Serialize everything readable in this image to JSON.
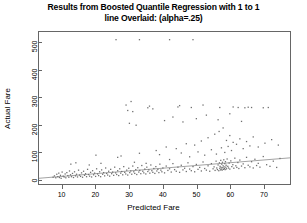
{
  "chart_data": {
    "type": "scatter",
    "title": "Results from Boosted Quantile Regression with 1 to 1 line Overlaid: (alpha=.25)",
    "title_line1": "Results from Boosted Quantile Regression with 1 to 1",
    "title_line2": "line Overlaid: (alpha=.25)",
    "xlabel": "Predicted Fare",
    "ylabel": "Actual Fare",
    "xlim": [
      3,
      78
    ],
    "ylim": [
      -18,
      540
    ],
    "xticks": [
      10,
      20,
      30,
      40,
      50,
      60,
      70
    ],
    "yticks": [
      0,
      100,
      200,
      300,
      400,
      500
    ],
    "grid": false,
    "legend": null,
    "point_color": "#6f6f6f",
    "line_color": "#8a8a8a",
    "frame_color": "#666666",
    "reference_line": {
      "label": "1 to 1 line",
      "x": [
        3,
        78
      ],
      "y": [
        3,
        78
      ],
      "type": "identity"
    },
    "points": [
      [
        7.2,
        7
      ],
      [
        7.6,
        12
      ],
      [
        8.0,
        5
      ],
      [
        8.3,
        18
      ],
      [
        8.6,
        9
      ],
      [
        8.9,
        22
      ],
      [
        9.1,
        6
      ],
      [
        9.4,
        14
      ],
      [
        9.6,
        3
      ],
      [
        9.9,
        26
      ],
      [
        10.2,
        11
      ],
      [
        10.5,
        8
      ],
      [
        10.8,
        19
      ],
      [
        11.0,
        5
      ],
      [
        11.3,
        24
      ],
      [
        11.6,
        13
      ],
      [
        11.9,
        7
      ],
      [
        12.1,
        30
      ],
      [
        12.4,
        16
      ],
      [
        12.7,
        9
      ],
      [
        13.0,
        21
      ],
      [
        13.3,
        6
      ],
      [
        13.6,
        27
      ],
      [
        13.9,
        12
      ],
      [
        14.2,
        18
      ],
      [
        14.5,
        8
      ],
      [
        14.8,
        33
      ],
      [
        15.1,
        15
      ],
      [
        15.4,
        10
      ],
      [
        15.7,
        23
      ],
      [
        16.0,
        7
      ],
      [
        16.3,
        29
      ],
      [
        16.6,
        14
      ],
      [
        16.9,
        20
      ],
      [
        17.2,
        9
      ],
      [
        17.5,
        36
      ],
      [
        17.8,
        17
      ],
      [
        18.1,
        11
      ],
      [
        18.4,
        25
      ],
      [
        18.7,
        8
      ],
      [
        19.0,
        31
      ],
      [
        19.3,
        16
      ],
      [
        19.6,
        22
      ],
      [
        19.9,
        10
      ],
      [
        20.2,
        38
      ],
      [
        20.5,
        19
      ],
      [
        20.8,
        13
      ],
      [
        21.1,
        27
      ],
      [
        21.4,
        9
      ],
      [
        21.7,
        34
      ],
      [
        22.0,
        18
      ],
      [
        22.3,
        24
      ],
      [
        22.6,
        12
      ],
      [
        22.9,
        41
      ],
      [
        23.2,
        21
      ],
      [
        23.5,
        15
      ],
      [
        23.8,
        29
      ],
      [
        24.1,
        11
      ],
      [
        24.4,
        36
      ],
      [
        24.7,
        20
      ],
      [
        25.0,
        26
      ],
      [
        25.3,
        14
      ],
      [
        25.6,
        44
      ],
      [
        25.9,
        23
      ],
      [
        26.2,
        17
      ],
      [
        26.5,
        31
      ],
      [
        26.8,
        13
      ],
      [
        27.1,
        38
      ],
      [
        27.4,
        22
      ],
      [
        27.7,
        28
      ],
      [
        28.0,
        16
      ],
      [
        28.3,
        46
      ],
      [
        28.6,
        25
      ],
      [
        28.9,
        19
      ],
      [
        29.2,
        33
      ],
      [
        29.5,
        15
      ],
      [
        29.8,
        40
      ],
      [
        30.1,
        24
      ],
      [
        30.4,
        30
      ],
      [
        30.7,
        18
      ],
      [
        31.0,
        48
      ],
      [
        31.3,
        27
      ],
      [
        31.6,
        21
      ],
      [
        31.9,
        35
      ],
      [
        32.2,
        17
      ],
      [
        32.5,
        42
      ],
      [
        32.8,
        26
      ],
      [
        33.1,
        32
      ],
      [
        33.4,
        20
      ],
      [
        33.7,
        50
      ],
      [
        34.0,
        29
      ],
      [
        34.3,
        23
      ],
      [
        34.6,
        37
      ],
      [
        34.9,
        19
      ],
      [
        35.2,
        44
      ],
      [
        35.5,
        28
      ],
      [
        35.8,
        34
      ],
      [
        36.1,
        22
      ],
      [
        36.4,
        52
      ],
      [
        36.7,
        31
      ],
      [
        37.0,
        25
      ],
      [
        37.3,
        39
      ],
      [
        37.6,
        21
      ],
      [
        37.9,
        46
      ],
      [
        38.2,
        30
      ],
      [
        38.5,
        36
      ],
      [
        38.8,
        24
      ],
      [
        39.1,
        55
      ],
      [
        39.4,
        33
      ],
      [
        39.7,
        27
      ],
      [
        40.0,
        41
      ],
      [
        40.5,
        23
      ],
      [
        41.0,
        48
      ],
      [
        41.5,
        32
      ],
      [
        42.0,
        38
      ],
      [
        42.5,
        26
      ],
      [
        43.0,
        57
      ],
      [
        43.5,
        35
      ],
      [
        44.0,
        29
      ],
      [
        44.5,
        44
      ],
      [
        45.0,
        25
      ],
      [
        45.5,
        51
      ],
      [
        46.0,
        34
      ],
      [
        46.5,
        40
      ],
      [
        47.0,
        28
      ],
      [
        47.5,
        60
      ],
      [
        48.0,
        37
      ],
      [
        48.5,
        31
      ],
      [
        49.0,
        46
      ],
      [
        49.5,
        27
      ],
      [
        50.0,
        54
      ],
      [
        50.5,
        36
      ],
      [
        51.0,
        43
      ],
      [
        51.5,
        30
      ],
      [
        52.0,
        63
      ],
      [
        52.5,
        39
      ],
      [
        53.0,
        33
      ],
      [
        53.5,
        49
      ],
      [
        54.0,
        29
      ],
      [
        54.5,
        57
      ],
      [
        55.0,
        38
      ],
      [
        55.3,
        45
      ],
      [
        55.6,
        32
      ],
      [
        55.9,
        66
      ],
      [
        56.1,
        41
      ],
      [
        56.3,
        35
      ],
      [
        56.5,
        52
      ],
      [
        56.7,
        31
      ],
      [
        56.9,
        60
      ],
      [
        57.0,
        40
      ],
      [
        57.1,
        47
      ],
      [
        57.2,
        34
      ],
      [
        57.3,
        69
      ],
      [
        57.4,
        43
      ],
      [
        57.5,
        37
      ],
      [
        57.6,
        55
      ],
      [
        57.7,
        33
      ],
      [
        57.8,
        62
      ],
      [
        57.9,
        42
      ],
      [
        58.0,
        49
      ],
      [
        58.1,
        36
      ],
      [
        58.2,
        71
      ],
      [
        58.3,
        45
      ],
      [
        58.4,
        39
      ],
      [
        58.5,
        57
      ],
      [
        58.6,
        35
      ],
      [
        58.7,
        64
      ],
      [
        58.8,
        44
      ],
      [
        58.9,
        51
      ],
      [
        59.0,
        38
      ],
      [
        59.2,
        74
      ],
      [
        59.4,
        47
      ],
      [
        59.6,
        41
      ],
      [
        59.8,
        59
      ],
      [
        60.0,
        37
      ],
      [
        60.3,
        67
      ],
      [
        60.6,
        46
      ],
      [
        60.9,
        53
      ],
      [
        61.2,
        40
      ],
      [
        61.5,
        77
      ],
      [
        61.8,
        49
      ],
      [
        62.1,
        43
      ],
      [
        62.4,
        61
      ],
      [
        62.7,
        39
      ],
      [
        63.0,
        70
      ],
      [
        63.5,
        48
      ],
      [
        64.0,
        56
      ],
      [
        64.5,
        42
      ],
      [
        65.0,
        80
      ],
      [
        65.5,
        51
      ],
      [
        66.0,
        45
      ],
      [
        66.5,
        64
      ],
      [
        67.0,
        41
      ],
      [
        67.5,
        73
      ],
      [
        68.0,
        50
      ],
      [
        68.5,
        58
      ],
      [
        69.0,
        44
      ],
      [
        70.0,
        83
      ],
      [
        71.0,
        53
      ],
      [
        72.0,
        47
      ],
      [
        73.0,
        66
      ],
      [
        74.0,
        43
      ],
      [
        75.0,
        76
      ],
      [
        12.5,
        55
      ],
      [
        14.0,
        60
      ],
      [
        18.0,
        52
      ],
      [
        20.0,
        88
      ],
      [
        21.5,
        58
      ],
      [
        26.5,
        80
      ],
      [
        27.5,
        85
      ],
      [
        31.5,
        62
      ],
      [
        33.0,
        95
      ],
      [
        35.0,
        58
      ],
      [
        38.0,
        105
      ],
      [
        39.0,
        90
      ],
      [
        41.0,
        118
      ],
      [
        42.0,
        72
      ],
      [
        44.0,
        112
      ],
      [
        45.5,
        96
      ],
      [
        47.0,
        130
      ],
      [
        48.0,
        82
      ],
      [
        49.5,
        125
      ],
      [
        50.5,
        100
      ],
      [
        51.5,
        140
      ],
      [
        52.5,
        88
      ],
      [
        53.5,
        152
      ],
      [
        54.5,
        108
      ],
      [
        55.5,
        165
      ],
      [
        56.0,
        92
      ],
      [
        56.8,
        175
      ],
      [
        57.5,
        115
      ],
      [
        58.0,
        188
      ],
      [
        58.5,
        98
      ],
      [
        59.0,
        142
      ],
      [
        59.5,
        120
      ],
      [
        60.0,
        160
      ],
      [
        60.5,
        105
      ],
      [
        61.0,
        135
      ],
      [
        62.0,
        128
      ],
      [
        63.0,
        148
      ],
      [
        64.0,
        112
      ],
      [
        65.0,
        138
      ],
      [
        66.0,
        122
      ],
      [
        67.0,
        155
      ],
      [
        68.5,
        118
      ],
      [
        70.5,
        132
      ],
      [
        72.5,
        145
      ],
      [
        74.5,
        125
      ],
      [
        30.0,
        205
      ],
      [
        32.0,
        198
      ],
      [
        40.5,
        215
      ],
      [
        43.0,
        228
      ],
      [
        46.0,
        210
      ],
      [
        50.0,
        222
      ],
      [
        53.0,
        235
      ],
      [
        56.5,
        218
      ],
      [
        60.0,
        240
      ],
      [
        63.5,
        212
      ],
      [
        35.5,
        262
      ],
      [
        36.0,
        268
      ],
      [
        37.0,
        258
      ],
      [
        44.5,
        265
      ],
      [
        45.0,
        270
      ],
      [
        48.5,
        263
      ],
      [
        52.0,
        272
      ],
      [
        57.0,
        263
      ],
      [
        61.0,
        265
      ],
      [
        62.5,
        263
      ],
      [
        64.5,
        262
      ],
      [
        65.5,
        264
      ],
      [
        66.5,
        263
      ],
      [
        70.0,
        262
      ],
      [
        71.5,
        263
      ],
      [
        29.0,
        272
      ],
      [
        29.5,
        252
      ],
      [
        30.5,
        285
      ],
      [
        31.0,
        248
      ],
      [
        26.0,
        512
      ],
      [
        33.0,
        512
      ],
      [
        42.0,
        512
      ],
      [
        49.0,
        512
      ]
    ]
  }
}
